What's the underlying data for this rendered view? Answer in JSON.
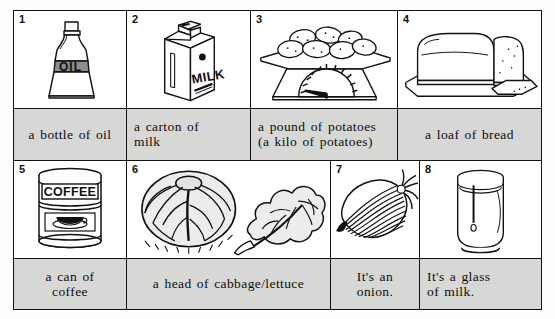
{
  "worksheet": {
    "title": "Food quantities picture vocabulary chart",
    "background_color": "#fdfdfd",
    "caption_background_color": "#d7d7d5",
    "border_color": "#111111"
  },
  "rows": [
    {
      "row_index": 1,
      "cells": [
        {
          "number": "1",
          "icon": "oil-bottle-icon",
          "caption": "a bottle of oil",
          "caption_align": "center"
        },
        {
          "number": "2",
          "icon": "milk-carton-icon",
          "caption": "a carton of\nmilk",
          "caption_line1": "a carton of",
          "caption_line2": "milk",
          "caption_align": "left"
        },
        {
          "number": "3",
          "icon": "potatoes-on-scale-icon",
          "caption_line1": "a pound of potatoes",
          "caption_line2": "(a kilo of potatoes)",
          "caption_align": "left"
        },
        {
          "number": "4",
          "icon": "bread-loaf-icon",
          "caption": "a loaf of bread",
          "caption_align": "center"
        }
      ]
    },
    {
      "row_index": 2,
      "cells": [
        {
          "number": "5",
          "icon": "coffee-can-icon",
          "caption_line1": "a can of",
          "caption_line2": "coffee",
          "caption_align": "center"
        },
        {
          "number": "6",
          "icon": "cabbage-lettuce-icon",
          "caption": "a head of cabbage/lettuce",
          "caption_align": "center"
        },
        {
          "number": "7",
          "icon": "onion-icon",
          "caption": "It's an onion.",
          "caption_align": "center"
        },
        {
          "number": "8",
          "icon": "glass-of-milk-icon",
          "caption_line1": "It's a glass",
          "caption_line2": "of milk.",
          "caption_align": "left"
        }
      ]
    }
  ],
  "labels_in_artwork": {
    "oil_bottle_label": "OIL",
    "milk_carton_label": "MILK",
    "coffee_can_label": "COFFEE"
  }
}
